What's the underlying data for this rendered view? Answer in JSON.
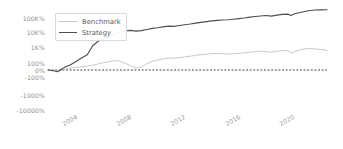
{
  "chart_data": {
    "type": "line",
    "title": "",
    "xlabel": "",
    "ylabel": "",
    "yscale": "symlog",
    "grid": false,
    "legend_position": "upper-left",
    "ytick_labels": [
      "100K%",
      "10K%",
      "1K%",
      "100%",
      "0%",
      "-100%",
      "-1000%",
      "-10000%"
    ],
    "ytick_values": [
      100000,
      10000,
      1000,
      100,
      0,
      -100,
      -1000,
      -10000
    ],
    "xtick_labels": [
      "2004",
      "2008",
      "2012",
      "2016",
      "2020"
    ],
    "xtick_values": [
      2004,
      2008,
      2012,
      2016,
      2020
    ],
    "xlim": [
      2002.3,
      2022.9
    ],
    "ylim": [
      -10000,
      400000
    ],
    "zero_line": {
      "value": 0,
      "style": "dashed",
      "color": "#4a4a4a"
    },
    "series": [
      {
        "name": "Benchmark",
        "color": "#c9c9c9",
        "x": [
          2002.3,
          2002.8,
          2003.0,
          2003.3,
          2003.6,
          2004.0,
          2004.4,
          2004.8,
          2005.2,
          2005.6,
          2006.0,
          2006.4,
          2006.8,
          2007.2,
          2007.6,
          2008.0,
          2008.4,
          2008.8,
          2009.2,
          2009.6,
          2010.0,
          2010.4,
          2010.8,
          2011.2,
          2011.6,
          2012.0,
          2012.4,
          2012.8,
          2013.2,
          2013.6,
          2014.0,
          2014.4,
          2014.8,
          2015.2,
          2015.6,
          2016.0,
          2016.4,
          2016.8,
          2017.2,
          2017.6,
          2018.0,
          2018.4,
          2018.8,
          2019.2,
          2019.6,
          2020.0,
          2020.25,
          2020.5,
          2021.0,
          2021.5,
          2022.0,
          2022.4,
          2022.9
        ],
        "y": [
          0,
          -12,
          -18,
          -5,
          14,
          30,
          38,
          46,
          58,
          70,
          86,
          104,
          122,
          140,
          132,
          96,
          60,
          28,
          42,
          88,
          130,
          150,
          178,
          205,
          196,
          215,
          240,
          262,
          300,
          330,
          356,
          378,
          392,
          380,
          360,
          382,
          405,
          430,
          470,
          505,
          540,
          525,
          470,
          540,
          590,
          600,
          420,
          520,
          700,
          800,
          760,
          700,
          620
        ]
      },
      {
        "name": "Strategy",
        "color": "#4f4f4f",
        "x": [
          2002.3,
          2002.8,
          2003.0,
          2003.3,
          2003.6,
          2004.0,
          2004.4,
          2004.8,
          2005.2,
          2005.6,
          2006.0,
          2006.4,
          2006.8,
          2007.2,
          2007.6,
          2008.0,
          2008.4,
          2008.8,
          2009.2,
          2009.6,
          2010.0,
          2010.4,
          2010.8,
          2011.2,
          2011.6,
          2012.0,
          2012.4,
          2012.8,
          2013.2,
          2013.6,
          2014.0,
          2014.4,
          2014.8,
          2015.2,
          2015.6,
          2016.0,
          2016.4,
          2016.8,
          2017.2,
          2017.6,
          2018.0,
          2018.4,
          2018.8,
          2019.2,
          2019.6,
          2020.0,
          2020.25,
          2020.5,
          2021.0,
          2021.5,
          2022.0,
          2022.4,
          2022.9
        ],
        "y": [
          0,
          -15,
          -25,
          10,
          45,
          80,
          130,
          210,
          330,
          1200,
          2400,
          3600,
          5000,
          7000,
          9500,
          12000,
          13000,
          11500,
          12500,
          15000,
          18000,
          20000,
          23000,
          26000,
          25000,
          29000,
          33000,
          37000,
          43000,
          49000,
          55000,
          62000,
          68000,
          72000,
          75000,
          82000,
          90000,
          100000,
          115000,
          128000,
          140000,
          150000,
          135000,
          160000,
          180000,
          190000,
          150000,
          200000,
          260000,
          330000,
          370000,
          380000,
          385000
        ]
      }
    ]
  },
  "legend": {
    "entries": [
      {
        "label": "Benchmark",
        "color": "#c9c9c9"
      },
      {
        "label": "Strategy",
        "color": "#4f4f4f"
      }
    ]
  },
  "axes": {
    "y_labels": [
      "100K%",
      "10K%",
      "1K%",
      "100%",
      "0%",
      "-100%",
      "-1000%",
      "-10000%"
    ],
    "x_labels": [
      "2004",
      "2008",
      "2012",
      "2016",
      "2020"
    ]
  }
}
